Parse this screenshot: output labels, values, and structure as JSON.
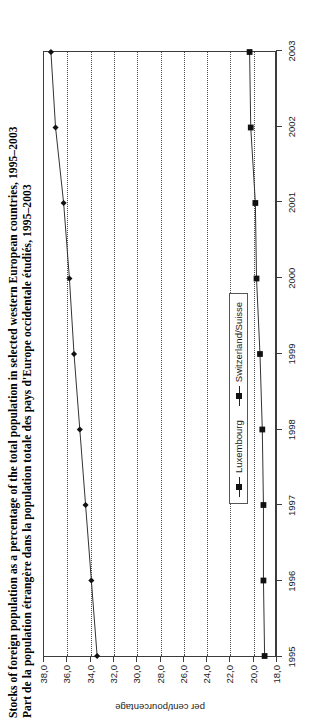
{
  "figure": {
    "title_en": "Stocks of foreign population as a percentage of the total population in selected western European countries, 1995–2003",
    "title_fr": "Part de la population étrangère dans la population totale des pays d'Europe occidentale étudiés, 1995–2003",
    "orientation": "rotated-90-ccw"
  },
  "axes": {
    "y_axis_title": "per cent/pourcentage",
    "y_tick_labels": [
      "38,0",
      "36,0",
      "34,0",
      "32,0",
      "30,0",
      "28,0",
      "26,0",
      "24,0",
      "22,0",
      "20,0",
      "18,0"
    ],
    "x_tick_labels": [
      "1995",
      "1996",
      "1997",
      "1998",
      "1999",
      "2000",
      "2001",
      "2002",
      "2003"
    ]
  },
  "legend": {
    "items": [
      {
        "label": "Luxembourg",
        "marker": "diamond-marker-icon",
        "color": "#111111"
      },
      {
        "label": "Switzerland/Suisse",
        "marker": "square-marker-icon",
        "color": "#111111"
      }
    ]
  },
  "chart_data": {
    "type": "line",
    "title": "Stocks of foreign population as a percentage of the total population in selected western European countries, 1995–2003",
    "subtitle": "Part de la population étrangère dans la population totale des pays d'Europe occidentale étudiés, 1995–2003",
    "xlabel": "",
    "ylabel": "per cent/pourcentage",
    "x": [
      1995,
      1996,
      1997,
      1998,
      1999,
      2000,
      2001,
      2002,
      2003
    ],
    "ylim": [
      18.0,
      38.0
    ],
    "ytick_step": 2.0,
    "grid": "horizontal-dotted",
    "legend_position": "inside-lower-right",
    "series": [
      {
        "name": "Luxembourg",
        "marker": "diamond",
        "values": [
          33.4,
          33.9,
          34.4,
          34.9,
          35.4,
          35.8,
          36.3,
          37.0,
          37.4
        ]
      },
      {
        "name": "Switzerland/Suisse",
        "marker": "square",
        "values": [
          18.9,
          19.0,
          19.0,
          19.1,
          19.3,
          19.6,
          19.7,
          20.1,
          20.2
        ]
      }
    ]
  }
}
